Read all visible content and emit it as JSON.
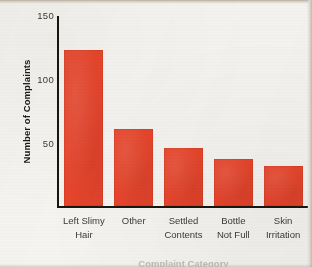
{
  "chart_data": {
    "type": "bar",
    "title": "",
    "subtitle": "",
    "xlabel": "Complaint Category",
    "ylabel": "Number of Complaints",
    "categories": [
      "Left Slimy Hair",
      "Other",
      "Settled Contents",
      "Bottle Not Full",
      "Skin Irritation"
    ],
    "category_lines": [
      [
        "Left Slimy",
        "Hair"
      ],
      [
        "Other",
        ""
      ],
      [
        "Settled",
        "Contents"
      ],
      [
        "Bottle",
        "Not Full"
      ],
      [
        "Skin",
        "Irritation"
      ]
    ],
    "values": [
      127,
      63,
      47,
      38,
      33
    ],
    "ylim": [
      0,
      155
    ],
    "yticks": [
      50,
      100,
      150
    ],
    "ytick_labels": [
      "50",
      "100",
      "150"
    ],
    "grid": false,
    "legend": false,
    "legend_position": "none",
    "bar_color": "#e8452c",
    "axis_color": "#17160f",
    "text_color": "#3b3a34",
    "background_color": "#f6f4f1"
  }
}
